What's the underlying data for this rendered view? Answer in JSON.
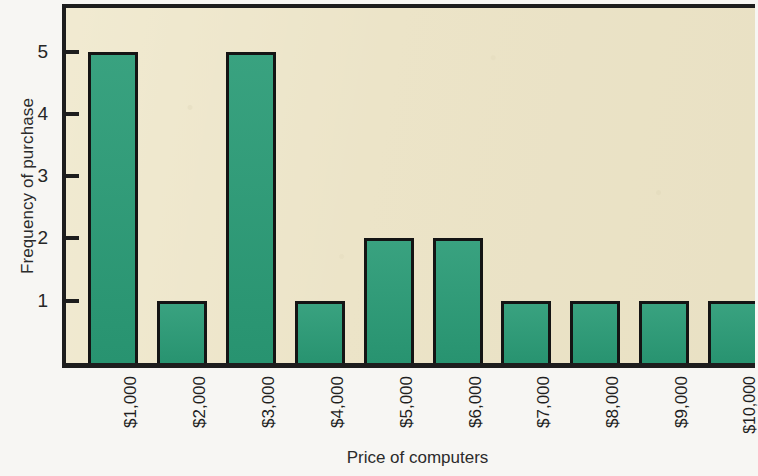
{
  "chart_data": {
    "type": "bar",
    "title": "",
    "xlabel": "Price of computers",
    "ylabel": "Frequency of purchase",
    "categories": [
      "$1,000",
      "$2,000",
      "$3,000",
      "$4,000",
      "$5,000",
      "$6,000",
      "$7,000",
      "$8,000",
      "$9,000",
      "$10,000"
    ],
    "values": [
      5,
      1,
      5,
      1,
      2,
      2,
      1,
      1,
      1,
      1
    ],
    "ylim": [
      0,
      5.7
    ],
    "y_ticks": [
      1,
      2,
      3,
      4,
      5
    ],
    "y_tick_labels": [
      "1",
      "2",
      "3",
      "4",
      "5"
    ],
    "grid": false,
    "legend": null,
    "bar_color": "#2a9b76",
    "bar_edge_color": "#141414",
    "plot_background": "#ece4c8",
    "axis_color": "#1d1d1d",
    "page_background": "#f7f6f3",
    "x_tick_label_rotation": 90
  }
}
